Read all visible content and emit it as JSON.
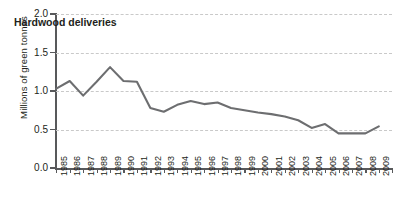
{
  "chart_data": {
    "type": "line",
    "title": "Hardwood deliveries",
    "xlabel": "",
    "ylabel": "Millions of green tonnes",
    "ylim": [
      0.0,
      2.0
    ],
    "yticks": [
      "0.0",
      "0.5",
      "1.0",
      "1.5",
      "2.0"
    ],
    "ytick_values": [
      0.0,
      0.5,
      1.0,
      1.5,
      2.0
    ],
    "grid": "horizontal-dashed",
    "legend": "none",
    "line_color": "#6d6e70",
    "categories": [
      "1985",
      "1986",
      "1987",
      "1988",
      "1989",
      "1990",
      "1991",
      "1992",
      "1993",
      "1994",
      "1995",
      "1996",
      "1997",
      "1998",
      "1999",
      "2000",
      "2001",
      "2002",
      "2003",
      "2004",
      "2005",
      "2006",
      "2007",
      "2008",
      "2009"
    ],
    "values": [
      1.03,
      1.13,
      0.94,
      1.12,
      1.31,
      1.13,
      1.12,
      0.78,
      0.73,
      0.82,
      0.87,
      0.83,
      0.85,
      0.78,
      0.75,
      0.72,
      0.7,
      0.67,
      0.62,
      0.52,
      0.57,
      0.45,
      0.45,
      0.45,
      0.54
    ]
  }
}
